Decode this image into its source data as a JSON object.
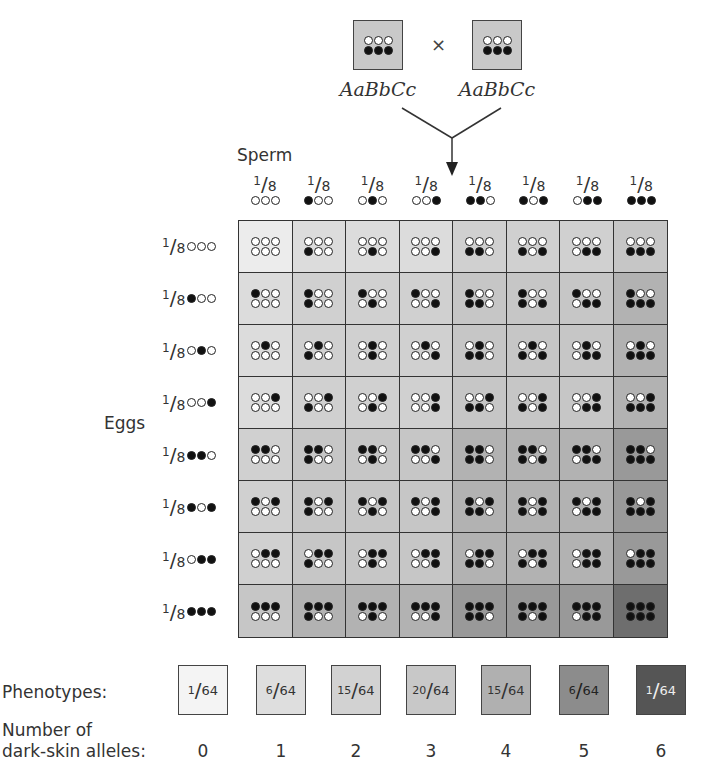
{
  "parents": {
    "left": {
      "genotype": "AaBbCc",
      "top_dots": [
        0,
        0,
        0
      ],
      "bottom_dots": [
        1,
        1,
        1
      ]
    },
    "right": {
      "genotype": "AaBbCc",
      "top_dots": [
        0,
        0,
        0
      ],
      "bottom_dots": [
        1,
        1,
        1
      ]
    },
    "cross_symbol": "×",
    "box_color": "#c9c9c9"
  },
  "labels": {
    "sperm": "Sperm",
    "eggs": "Eggs",
    "phenotypes": "Phenotypes:",
    "alleles_line1": "Number of",
    "alleles_line2": "dark-skin alleles:"
  },
  "gametes": {
    "fraction_numerator": "1",
    "fraction_denominator": "8",
    "sperm": [
      [
        0,
        0,
        0
      ],
      [
        1,
        0,
        0
      ],
      [
        0,
        1,
        0
      ],
      [
        0,
        0,
        1
      ],
      [
        1,
        1,
        0
      ],
      [
        1,
        0,
        1
      ],
      [
        0,
        1,
        1
      ],
      [
        1,
        1,
        1
      ]
    ],
    "eggs": [
      [
        0,
        0,
        0
      ],
      [
        1,
        0,
        0
      ],
      [
        0,
        1,
        0
      ],
      [
        0,
        0,
        1
      ],
      [
        1,
        1,
        0
      ],
      [
        1,
        0,
        1
      ],
      [
        0,
        1,
        1
      ],
      [
        1,
        1,
        1
      ]
    ]
  },
  "cell_layout": "top row of dots = egg allele, bottom row = sperm allele (filled = dark-skin allele)",
  "shade_colors": [
    "#ececec",
    "#dcdcdc",
    "#d0d0d0",
    "#c6c6c6",
    "#b2b2b2",
    "#999999",
    "#6e6e6e"
  ],
  "phenotypes": [
    {
      "numerator": "1",
      "denominator": "64",
      "dark_alleles": "0",
      "color": "#f4f4f4",
      "text_color": "#333333"
    },
    {
      "numerator": "6",
      "denominator": "64",
      "dark_alleles": "1",
      "color": "#dedede",
      "text_color": "#333333"
    },
    {
      "numerator": "15",
      "denominator": "64",
      "dark_alleles": "2",
      "color": "#d2d2d2",
      "text_color": "#333333"
    },
    {
      "numerator": "20",
      "denominator": "64",
      "dark_alleles": "3",
      "color": "#c8c8c8",
      "text_color": "#333333"
    },
    {
      "numerator": "15",
      "denominator": "64",
      "dark_alleles": "4",
      "color": "#b0b0b0",
      "text_color": "#333333"
    },
    {
      "numerator": "6",
      "denominator": "64",
      "dark_alleles": "5",
      "color": "#8c8c8c",
      "text_color": "#222222"
    },
    {
      "numerator": "1",
      "denominator": "64",
      "dark_alleles": "6",
      "color": "#555555",
      "text_color": "#eeeeee"
    }
  ]
}
